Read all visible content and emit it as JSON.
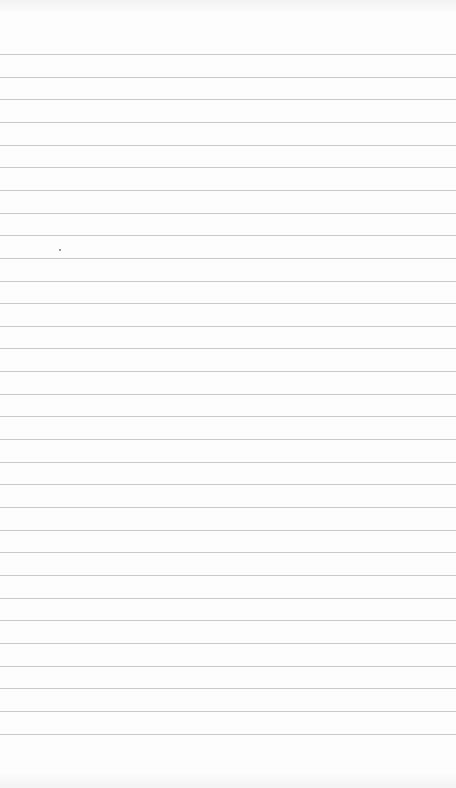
{
  "page": {
    "type": "lined-paper",
    "background_color": "#fdfdfd",
    "line_color": "#c9c9c9"
  },
  "lines": {
    "count": 31,
    "first_y": 54,
    "spacing": 22.65
  },
  "marks": [
    {
      "x": 59,
      "y": 249
    }
  ]
}
